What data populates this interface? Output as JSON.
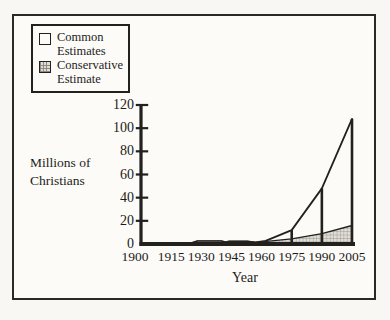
{
  "figure": {
    "paper_color": "#f9f7f3",
    "ink_color": "#22211e",
    "hatch_fill": "#e0ddd7",
    "hatch_line": "#8f8b84"
  },
  "legend": {
    "items": [
      {
        "name": "Common Estimates",
        "swatch": "white-square",
        "lines": [
          "Common",
          "Estimates"
        ]
      },
      {
        "name": "Conservative Estimate",
        "swatch": "hatched-square",
        "lines": [
          "Conservative",
          "Estimate"
        ]
      }
    ]
  },
  "chart_data": {
    "type": "area",
    "title": "",
    "xlabel": "Year",
    "ylabel": "Millions of Christians",
    "ylabel_lines": [
      "Millions of",
      "Christians"
    ],
    "xlim": [
      1900,
      2005
    ],
    "ylim": [
      0,
      120
    ],
    "xticks": [
      1900,
      1915,
      1930,
      1945,
      1960,
      1975,
      1990,
      2005
    ],
    "yticks": [
      0,
      20,
      40,
      60,
      80,
      100,
      120
    ],
    "grid": false,
    "legend_position": "top-left",
    "series": [
      {
        "name": "Common Estimates",
        "fill": "white",
        "points": [
          [
            1900,
            0.3
          ],
          [
            1913,
            0.5
          ],
          [
            1925,
            0.8
          ],
          [
            1928,
            2.5
          ],
          [
            1940,
            2.5
          ],
          [
            1942,
            1.6
          ],
          [
            1944,
            2.3
          ],
          [
            1953,
            2.2
          ],
          [
            1957,
            1.5
          ],
          [
            1962,
            2.8
          ],
          [
            1975,
            12
          ],
          [
            1990,
            48
          ],
          [
            2005,
            108
          ]
        ]
      },
      {
        "name": "Conservative Estimate",
        "fill": "crosshatch",
        "points": [
          [
            1900,
            0.3
          ],
          [
            1913,
            0.5
          ],
          [
            1925,
            0.8
          ],
          [
            1928,
            2.5
          ],
          [
            1940,
            2.5
          ],
          [
            1942,
            1.6
          ],
          [
            1944,
            2.3
          ],
          [
            1953,
            2.2
          ],
          [
            1957,
            1.5
          ],
          [
            1960,
            1.8
          ],
          [
            1975,
            4.5
          ],
          [
            1990,
            9
          ],
          [
            2005,
            16
          ]
        ]
      }
    ],
    "droplines": [
      [
        1975,
        12
      ],
      [
        1990,
        48
      ],
      [
        2005,
        108
      ]
    ]
  }
}
